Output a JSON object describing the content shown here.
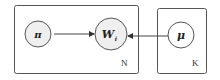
{
  "diagram": {
    "type": "plate-notation-graphical-model",
    "nodes": [
      {
        "id": "pi",
        "label": "π",
        "shaded": true
      },
      {
        "id": "W",
        "label": "W",
        "subscript": "i",
        "shaded": true
      },
      {
        "id": "mu",
        "label": "μ",
        "shaded": false
      }
    ],
    "edges": [
      {
        "from": "pi",
        "to": "W"
      },
      {
        "from": "mu",
        "to": "W"
      }
    ],
    "plates": [
      {
        "id": "plate-N",
        "label": "N",
        "contains": [
          "pi",
          "W"
        ]
      },
      {
        "id": "plate-K",
        "label": "K",
        "contains": [
          "mu"
        ]
      }
    ]
  }
}
